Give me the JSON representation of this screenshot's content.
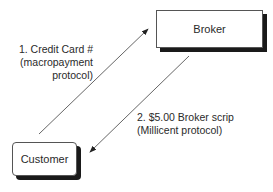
{
  "nodes": {
    "broker": {
      "label": "Broker"
    },
    "customer": {
      "label": "Customer"
    }
  },
  "edges": [
    {
      "from": "customer",
      "to": "broker",
      "lines": [
        "1. Credit Card #",
        "(macropayment",
        "protocol)"
      ]
    },
    {
      "from": "broker",
      "to": "customer",
      "lines": [
        "2. $5.00 Broker scrip",
        "(Millicent protocol)"
      ]
    }
  ],
  "colors": {
    "line": "#444444",
    "shadow": "#1a1a1a",
    "text": "#2a2a2a"
  }
}
